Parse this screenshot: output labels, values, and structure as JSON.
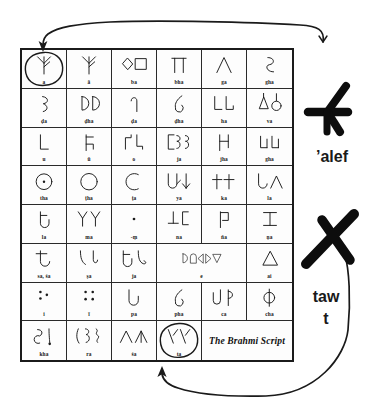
{
  "figure": {
    "caption": "The Brahmi Script",
    "title_note": "Brahmi script chart with two letters circled and compared to Semitic letters"
  },
  "table": {
    "columns": 6,
    "rows": 8,
    "cells": [
      {
        "rom": "a",
        "glyph": "a",
        "circled": true
      },
      {
        "rom": "ā",
        "glyph": "aa",
        "circled": false
      },
      {
        "rom": "ba",
        "glyph": "ba",
        "circled": false
      },
      {
        "rom": "bha",
        "glyph": "bha",
        "circled": false
      },
      {
        "rom": "ga",
        "glyph": "ga",
        "circled": false
      },
      {
        "rom": "gha",
        "glyph": "gha",
        "circled": false
      },
      {
        "rom": "ḍa",
        "glyph": "dda",
        "circled": false
      },
      {
        "rom": "ḍha",
        "glyph": "ddha",
        "circled": false
      },
      {
        "rom": "ḍa",
        "glyph": "da2",
        "circled": false
      },
      {
        "rom": "ḍha",
        "glyph": "dha2",
        "circled": false
      },
      {
        "rom": "ha",
        "glyph": "ha",
        "circled": false
      },
      {
        "rom": "va",
        "glyph": "va",
        "circled": false
      },
      {
        "rom": "u",
        "glyph": "u",
        "circled": false
      },
      {
        "rom": "ū",
        "glyph": "uu",
        "circled": false
      },
      {
        "rom": "o",
        "glyph": "o",
        "circled": false
      },
      {
        "rom": "ja",
        "glyph": "ja",
        "circled": false
      },
      {
        "rom": "jha",
        "glyph": "jha",
        "circled": false
      },
      {
        "rom": "gha",
        "glyph": "gha2",
        "circled": false
      },
      {
        "rom": "tha",
        "glyph": "tha",
        "circled": false
      },
      {
        "rom": "ṭha",
        "glyph": "ttha",
        "circled": false
      },
      {
        "rom": "ṭa",
        "glyph": "tta",
        "circled": false
      },
      {
        "rom": "ya",
        "glyph": "ya",
        "circled": false
      },
      {
        "rom": "ka",
        "glyph": "ka",
        "circled": false
      },
      {
        "rom": "la",
        "glyph": "la",
        "circled": false
      },
      {
        "rom": "la",
        "glyph": "la2",
        "circled": false
      },
      {
        "rom": "ma",
        "glyph": "ma",
        "circled": false
      },
      {
        "rom": "-ṃ",
        "glyph": "anusvara",
        "circled": false
      },
      {
        "rom": "na",
        "glyph": "na",
        "circled": false
      },
      {
        "rom": "ña",
        "glyph": "nya",
        "circled": false
      },
      {
        "rom": "ṇa",
        "glyph": "nna",
        "circled": false
      },
      {
        "rom": "sa, śa",
        "glyph": "sa",
        "circled": false
      },
      {
        "rom": "ṣa",
        "glyph": "ssa",
        "circled": false
      },
      {
        "rom": "ja",
        "glyph": "ja2",
        "circled": false
      },
      {
        "rom": "e",
        "glyph": "e",
        "circled": false
      },
      {
        "rom": "ai",
        "glyph": "ai",
        "circled": false
      },
      {
        "rom": "i",
        "glyph": "i",
        "circled": false
      },
      {
        "rom": "ī",
        "glyph": "ii",
        "circled": false
      },
      {
        "rom": "pa",
        "glyph": "pa",
        "circled": false
      },
      {
        "rom": "pha",
        "glyph": "pha",
        "circled": false
      },
      {
        "rom": "ca",
        "glyph": "ca",
        "circled": false
      },
      {
        "rom": "cha",
        "glyph": "cha",
        "circled": false
      },
      {
        "rom": "kha",
        "glyph": "kha",
        "circled": false
      },
      {
        "rom": "ra",
        "glyph": "ra",
        "circled": false
      },
      {
        "rom": "śa",
        "glyph": "sha",
        "circled": false
      },
      {
        "rom": "ta",
        "glyph": "ta",
        "circled": true
      }
    ]
  },
  "annotations": {
    "alef_label": "’alef",
    "taw_label": "taw",
    "t_label": "t",
    "alef_glyph": "semitic-alef",
    "taw_glyph": "semitic-taw",
    "arrow_top": "arrow-from-alef-to-brahmi-a",
    "arrow_bottom": "arrow-from-taw-to-brahmi-ta"
  },
  "colors": {
    "ink": "#1a1a1a",
    "rule": "#2a2a2a",
    "background": "#ffffff"
  }
}
